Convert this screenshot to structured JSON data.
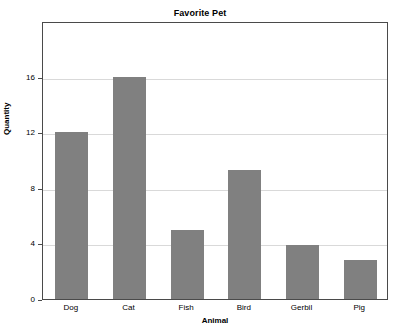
{
  "chart_data": {
    "type": "bar",
    "title": "Favorite Pet",
    "xlabel": "Animal",
    "ylabel": "Quantity",
    "categories": [
      "Dog",
      "Cat",
      "Fish",
      "Bird",
      "Gerbil",
      "Pig"
    ],
    "values": [
      12,
      16,
      5,
      9.3,
      3.9,
      2.8
    ],
    "ylim": [
      0,
      20
    ],
    "yticks": [
      0,
      4,
      8,
      12,
      16
    ],
    "ytick_labels": [
      "0",
      "4",
      "8",
      "12",
      "16"
    ],
    "grid": true,
    "legend": false,
    "bar_color": "#808080",
    "grid_color": "#d9d9d9",
    "axis_color": "#4a4a4a",
    "background_color": "#ffffff"
  }
}
